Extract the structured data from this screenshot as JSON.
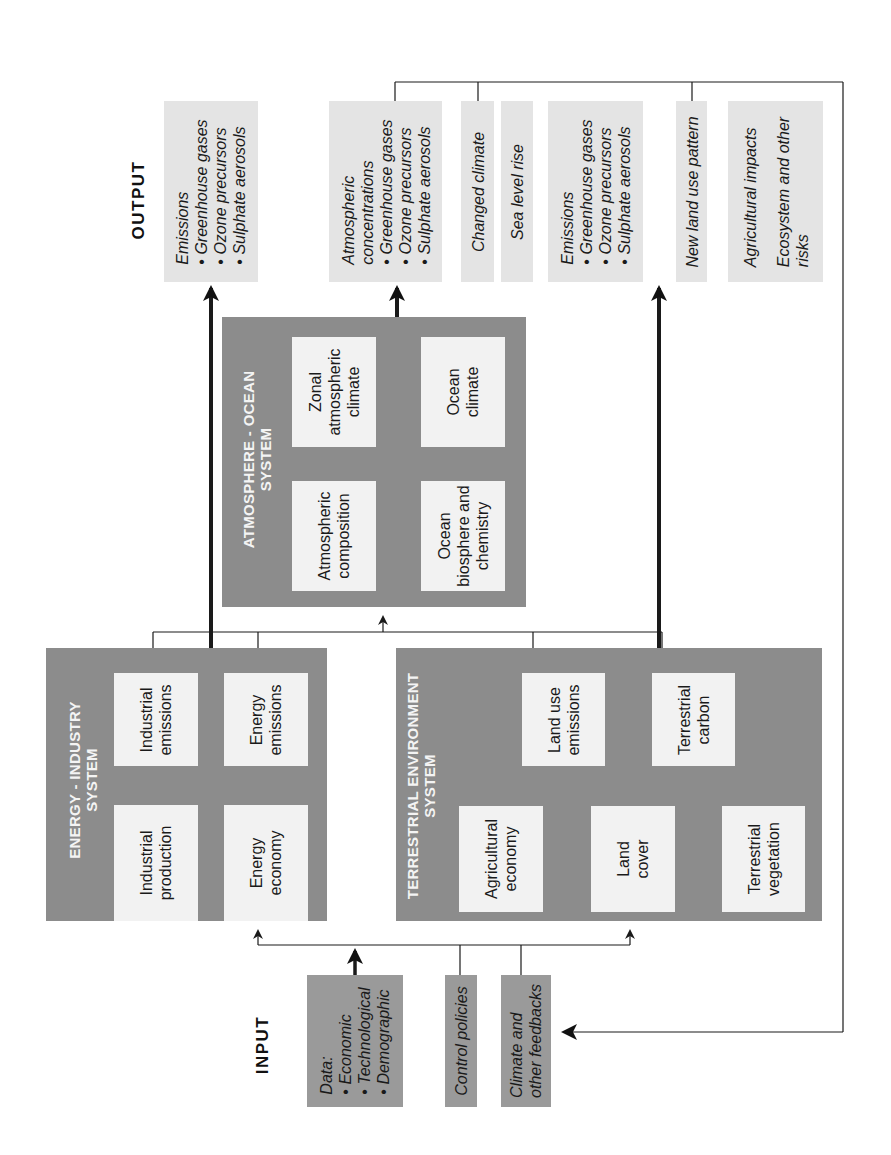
{
  "labels": {
    "input": "INPUT",
    "output": "OUTPUT"
  },
  "inputs": {
    "data": {
      "heading": "Data:",
      "items": [
        "Economic",
        "Technological",
        "Demographic"
      ]
    },
    "control_policies": "Control policies",
    "climate_feedbacks": [
      "Climate and",
      "other feedbacks"
    ]
  },
  "systems": {
    "energy_industry": {
      "title": [
        "ENERGY - INDUSTRY",
        "SYSTEM"
      ],
      "industrial_production": [
        "Industrial",
        "production"
      ],
      "industrial_emissions": [
        "Industrial",
        "emissions"
      ],
      "energy_economy": [
        "Energy",
        "economy"
      ],
      "energy_emissions": [
        "Energy",
        "emissions"
      ]
    },
    "terrestrial": {
      "title": [
        "TERRESTRIAL ENVIRONMENT",
        "SYSTEM"
      ],
      "agricultural_economy": [
        "Agricultural",
        "economy"
      ],
      "land_cover": [
        "Land",
        "cover"
      ],
      "terrestrial_vegetation": [
        "Terrestrial",
        "vegetation"
      ],
      "land_use_emissions": [
        "Land use",
        "emissions"
      ],
      "terrestrial_carbon": [
        "Terrestrial",
        "carbon"
      ]
    },
    "atmosphere_ocean": {
      "title": [
        "ATMOSPHERE - OCEAN",
        "SYSTEM"
      ],
      "atmospheric_composition": [
        "Atmospheric",
        "composition"
      ],
      "zonal_climate": [
        "Zonal",
        "atmospheric",
        "climate"
      ],
      "ocean_biosphere": [
        "Ocean",
        "biosphere and",
        "chemistry"
      ],
      "ocean_climate": [
        "Ocean",
        "climate"
      ]
    }
  },
  "outputs": {
    "emissions_1": {
      "heading": "Emissions",
      "items": [
        "Greenhouse gases",
        "Ozone precursors",
        "Sulphate aerosols"
      ]
    },
    "concentrations": {
      "heading": [
        "Atmospheric",
        "concentrations"
      ],
      "items": [
        "Greenhouse gases",
        "Ozone precursors",
        "Sulphate aerosols"
      ]
    },
    "changed_climate": "Changed climate",
    "sea_level_rise": "Sea level rise",
    "emissions_2": {
      "heading": "Emissions",
      "items": [
        "Greenhouse gases",
        "Ozone precursors",
        "Sulphate aerosols"
      ]
    },
    "new_land_use": "New land use pattern",
    "impacts": {
      "agricultural": "Agricultural impacts",
      "ecosystem": [
        "Ecosystem and other",
        "risks"
      ]
    }
  },
  "colors": {
    "system_fill": "#8c8c8c",
    "inner_fill": "#f2f2f2",
    "output_fill": "#e4e4e4",
    "input_fill": "#9a9a9a",
    "line": "#1a1a1a"
  }
}
